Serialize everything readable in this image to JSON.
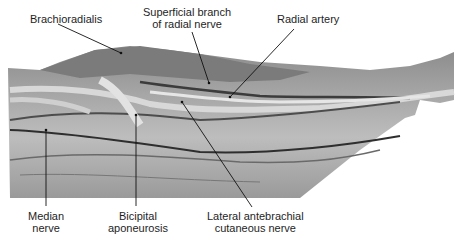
{
  "figure": {
    "labels": {
      "brachioradialis": "Brachioradialis",
      "superficial_branch_line1": "Superficial branch",
      "superficial_branch_line2": "of radial nerve",
      "radial_artery": "Radial artery",
      "median_nerve_line1": "Median",
      "median_nerve_line2": "nerve",
      "bicipital_line1": "Bicipital",
      "bicipital_line2": "aponeurosis",
      "lateral_line1": "Lateral antebrachial",
      "lateral_line2": "cutaneous nerve"
    }
  }
}
